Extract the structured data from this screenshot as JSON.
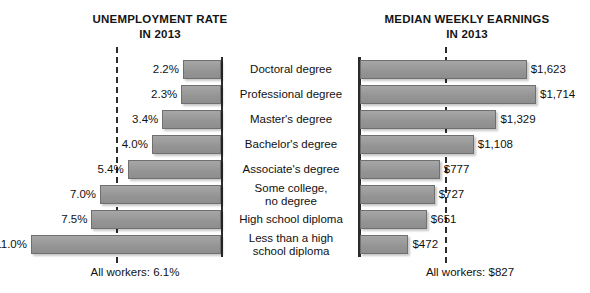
{
  "chart_data": [
    {
      "type": "bar",
      "title": "UNEMPLOYMENT RATE IN 2013",
      "title_line1": "UNEMPLOYMENT RATE",
      "title_line2": "IN 2013",
      "orientation": "horizontal-left",
      "xlabel": "",
      "ylabel": "",
      "unit": "percent",
      "xlim": [
        0,
        11.0
      ],
      "grid": false,
      "legend": "none",
      "reference_line": {
        "label": "All workers: 6.1%",
        "value": 6.1,
        "style": "dashed"
      },
      "categories": [
        "Doctoral degree",
        "Professional degree",
        "Master's degree",
        "Bachelor's degree",
        "Associate's degree",
        "Some college, no degree",
        "High school diploma",
        "Less than a high school diploma"
      ],
      "values": [
        2.2,
        2.3,
        3.4,
        4.0,
        5.4,
        7.0,
        7.5,
        11.0
      ],
      "value_labels": [
        "2.2%",
        "2.3%",
        "3.4%",
        "4.0%",
        "5.4%",
        "7.0%",
        "7.5%",
        "11.0%"
      ]
    },
    {
      "type": "bar",
      "title": "MEDIAN WEEKLY EARNINGS IN 2013",
      "title_line1": "MEDIAN WEEKLY EARNINGS",
      "title_line2": "IN 2013",
      "orientation": "horizontal-right",
      "xlabel": "",
      "ylabel": "",
      "unit": "usd-per-week",
      "xlim": [
        0,
        1714
      ],
      "grid": false,
      "legend": "none",
      "reference_line": {
        "label": "All workers: $827",
        "value": 827,
        "style": "dashed"
      },
      "categories": [
        "Doctoral degree",
        "Professional degree",
        "Master's degree",
        "Bachelor's degree",
        "Associate's degree",
        "Some college, no degree",
        "High school diploma",
        "Less than a high school diploma"
      ],
      "values": [
        1623,
        1714,
        1329,
        1108,
        777,
        727,
        651,
        472
      ],
      "value_labels": [
        "$1,623",
        "$1,714",
        "$1,329",
        "$1,108",
        "$777",
        "$727",
        "$651",
        "$472"
      ]
    }
  ],
  "left_chart": {
    "title_line1": "UNEMPLOYMENT RATE",
    "title_line2": "IN 2013",
    "footer": "All workers: 6.1%",
    "labels": [
      "2.2%",
      "2.3%",
      "3.4%",
      "4.0%",
      "5.4%",
      "7.0%",
      "7.5%",
      "11.0%"
    ]
  },
  "right_chart": {
    "title_line1": "MEDIAN WEEKLY EARNINGS",
    "title_line2": "IN 2013",
    "footer": "All workers: $827",
    "labels": [
      "$1,623",
      "$1,714",
      "$1,329",
      "$1,108",
      "$777",
      "$727",
      "$651",
      "$472"
    ]
  },
  "categories": [
    {
      "line1": "Doctoral degree",
      "line2": ""
    },
    {
      "line1": "Professional degree",
      "line2": ""
    },
    {
      "line1": "Master's degree",
      "line2": ""
    },
    {
      "line1": "Bachelor's degree",
      "line2": ""
    },
    {
      "line1": "Associate's degree",
      "line2": ""
    },
    {
      "line1": "Some college,",
      "line2": "no degree"
    },
    {
      "line1": "High school diploma",
      "line2": ""
    },
    {
      "line1": "Less than a high",
      "line2": "school diploma"
    }
  ],
  "colors": {
    "bar_fill": "#9a9a9a",
    "bar_stroke": "#6f6f6f",
    "axis": "#2b2b2b",
    "text": "#111111",
    "background": "#ffffff"
  }
}
